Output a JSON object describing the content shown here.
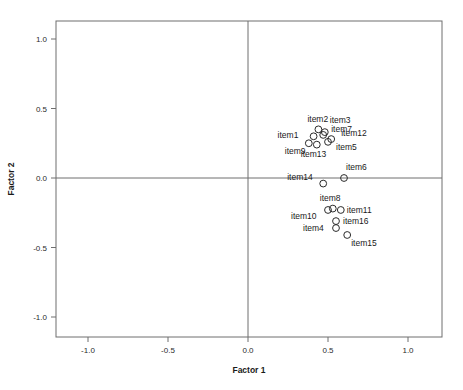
{
  "chart_data": {
    "type": "scatter",
    "title": "",
    "xlabel": "Factor 1",
    "ylabel": "Factor 2",
    "xlim": [
      -1.2,
      1.2
    ],
    "ylim": [
      -1.13,
      1.13
    ],
    "xticks": [
      -1.0,
      -0.5,
      0.0,
      0.5,
      1.0
    ],
    "yticks": [
      -1.0,
      -0.5,
      0.0,
      0.5,
      1.0
    ],
    "xtick_labels": [
      "-1.0",
      "-0.5",
      "0.0",
      "0.5",
      "1.0"
    ],
    "ytick_labels": [
      "-1.0",
      "-0.5",
      "0.0",
      "0.5",
      "1.0"
    ],
    "grid": false,
    "legend": "none",
    "reference_lines": {
      "vertical_at_x": 0.0,
      "horizontal_at_y": 0.0
    },
    "marker_style": "open-circle",
    "points": [
      {
        "label": "item1",
        "x": 0.41,
        "y": 0.3,
        "label_dx": -36,
        "label_dy": 2
      },
      {
        "label": "item2",
        "x": 0.44,
        "y": 0.35,
        "label_dx": -11,
        "label_dy": -7
      },
      {
        "label": "item3",
        "x": 0.48,
        "y": 0.33,
        "label_dx": 5,
        "label_dy": -9
      },
      {
        "label": "item4",
        "x": 0.55,
        "y": -0.36,
        "label_dx": -33,
        "label_dy": 3
      },
      {
        "label": "item5",
        "x": 0.5,
        "y": 0.26,
        "label_dx": 8,
        "label_dy": 8
      },
      {
        "label": "item6",
        "x": 0.6,
        "y": 0.0,
        "label_dx": 2,
        "label_dy": -8
      },
      {
        "label": "item7",
        "x": 0.47,
        "y": 0.31,
        "label_dx": 8,
        "label_dy": -3
      },
      {
        "label": "item8",
        "x": 0.53,
        "y": -0.22,
        "label_dx": -13,
        "label_dy": -8
      },
      {
        "label": "item9",
        "x": 0.38,
        "y": 0.25,
        "label_dx": -24,
        "label_dy": 11
      },
      {
        "label": "item10",
        "x": 0.5,
        "y": -0.23,
        "label_dx": -37,
        "label_dy": 9
      },
      {
        "label": "item11",
        "x": 0.58,
        "y": -0.23,
        "label_dx": 6,
        "label_dy": 3
      },
      {
        "label": "item12",
        "x": 0.52,
        "y": 0.28,
        "label_dx": 10,
        "label_dy": -3
      },
      {
        "label": "item13",
        "x": 0.43,
        "y": 0.24,
        "label_dx": -16,
        "label_dy": 12
      },
      {
        "label": "item14",
        "x": 0.47,
        "y": -0.04,
        "label_dx": -36,
        "label_dy": -4
      },
      {
        "label": "item15",
        "x": 0.62,
        "y": -0.41,
        "label_dx": 4,
        "label_dy": 11
      },
      {
        "label": "item16",
        "x": 0.55,
        "y": -0.31,
        "label_dx": 7,
        "label_dy": 3
      }
    ]
  }
}
